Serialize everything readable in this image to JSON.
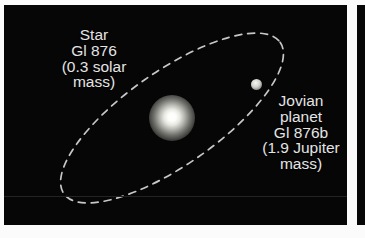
{
  "figure": {
    "background_color": "#060606",
    "text_color": "#e4e4e4",
    "orbit_color": "#d8d8d8"
  },
  "star": {
    "name_line": "Star",
    "designation": "Gl 876",
    "mass_line1": "(0.3 solar",
    "mass_line2": "mass)",
    "mass_value": 0.3,
    "mass_unit": "solar mass",
    "marker_color": "#ffffff"
  },
  "planet": {
    "type_line1": "Jovian",
    "type_line2": "planet",
    "designation": "Gl 876b",
    "mass_line1": "(1.9 Jupiter",
    "mass_line2": "mass)",
    "mass_value": 1.9,
    "mass_unit": "Jupiter mass",
    "marker_color": "#e0e0dc"
  },
  "orbit": {
    "style": "dashed-ellipse",
    "tilt_degrees": -35,
    "semi_major_px": 132,
    "semi_minor_px": 47,
    "dash_pattern": "7 6"
  }
}
